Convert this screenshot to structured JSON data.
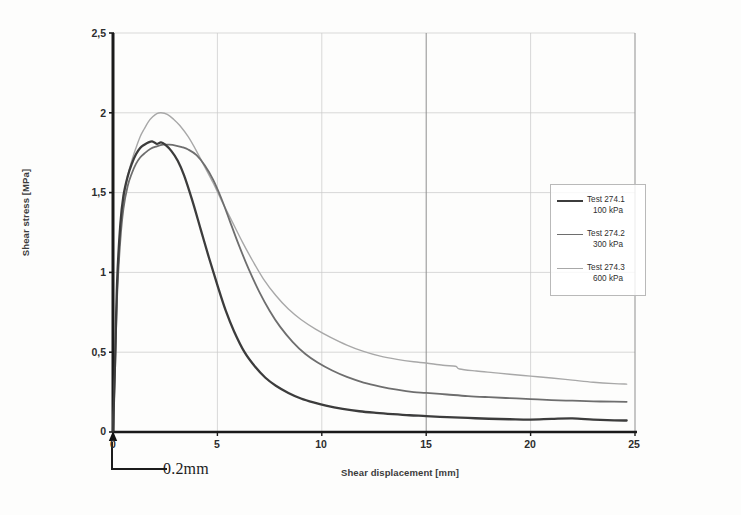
{
  "figure": {
    "background_color": "#fdfdfc",
    "axis_color": "#1a1a1a",
    "grid_color": "#c8c8c8",
    "grid_color_major": "#8f8f8f"
  },
  "axes": {
    "y_title": "Shear stress [MPa]",
    "x_title": "Shear displacement [mm]",
    "y_ticks": [
      "0",
      "0,5",
      "1",
      "1,5",
      "2",
      "2,5"
    ],
    "x_ticks": [
      "0",
      "5",
      "10",
      "15",
      "20",
      "25"
    ]
  },
  "annotation": {
    "callout_label": "0.2mm"
  },
  "legend": {
    "entries": [
      {
        "name": "Test 274.1",
        "sub": "100 kPa",
        "color": "#3c3c3c",
        "width": 2.3
      },
      {
        "name": "Test 274.2",
        "sub": "300 kPa",
        "color": "#6e6e6e",
        "width": 1.8
      },
      {
        "name": "Test 274.3",
        "sub": "600 kPa",
        "color": "#a8a8a8",
        "width": 1.4
      }
    ]
  },
  "chart_data": {
    "type": "line",
    "title": "",
    "xlabel": "Shear displacement [mm]",
    "ylabel": "Shear stress [MPa]",
    "xlim": [
      0,
      25
    ],
    "ylim": [
      0,
      2.5
    ],
    "xticks": [
      0,
      5,
      10,
      15,
      20,
      25
    ],
    "yticks": [
      0,
      0.5,
      1,
      1.5,
      2,
      2.5
    ],
    "grid": true,
    "legend_position": "right",
    "decimal_separator_ticks": ",",
    "annotations": [
      {
        "text": "0.2mm",
        "meaning": "horizontal scale bar below origin indicating 0.2 mm interval"
      }
    ],
    "series": [
      {
        "name": "Test 274.1",
        "label": "Test 274.1 100 kPa",
        "normal_stress_kPa": 100,
        "color": "#3c3c3c",
        "peak_stress_MPa": 1.82,
        "peak_displacement_mm": 2.0,
        "residual_stress_MPa": 0.07,
        "x": [
          0,
          0.1,
          0.2,
          0.35,
          0.5,
          0.7,
          0.9,
          1.1,
          1.3,
          1.5,
          1.7,
          1.9,
          2.1,
          2.3,
          2.5,
          2.8,
          3.1,
          3.4,
          3.8,
          4.2,
          4.6,
          5.0,
          5.4,
          5.8,
          6.3,
          6.8,
          7.3,
          7.8,
          8.4,
          9.0,
          9.6,
          10.2,
          11.0,
          11.8,
          12.6,
          13.4,
          14.2,
          15.0,
          16.0,
          17.0,
          18.0,
          19.0,
          20.0,
          21.0,
          22.0,
          23.0,
          24.0,
          24.6
        ],
        "y": [
          0,
          0.45,
          0.95,
          1.3,
          1.48,
          1.6,
          1.68,
          1.74,
          1.78,
          1.8,
          1.815,
          1.82,
          1.805,
          1.815,
          1.8,
          1.76,
          1.7,
          1.61,
          1.45,
          1.27,
          1.09,
          0.92,
          0.76,
          0.63,
          0.5,
          0.41,
          0.34,
          0.29,
          0.245,
          0.21,
          0.185,
          0.165,
          0.145,
          0.13,
          0.12,
          0.112,
          0.105,
          0.1,
          0.093,
          0.088,
          0.083,
          0.08,
          0.078,
          0.082,
          0.085,
          0.078,
          0.073,
          0.072
        ]
      },
      {
        "name": "Test 274.2",
        "label": "Test 274.2 300 kPa",
        "normal_stress_kPa": 300,
        "color": "#6e6e6e",
        "peak_stress_MPa": 1.8,
        "peak_displacement_mm": 2.4,
        "residual_stress_MPa": 0.19,
        "x": [
          0,
          0.1,
          0.2,
          0.35,
          0.5,
          0.7,
          0.9,
          1.1,
          1.3,
          1.5,
          1.8,
          2.1,
          2.4,
          2.7,
          3.0,
          3.3,
          3.6,
          4.0,
          4.4,
          4.8,
          5.2,
          5.6,
          6.0,
          6.5,
          7.0,
          7.5,
          8.0,
          8.6,
          9.2,
          9.8,
          10.5,
          11.2,
          12.0,
          12.8,
          13.6,
          14.4,
          15.0,
          16.0,
          17.0,
          18.0,
          19.0,
          20.0,
          21.0,
          22.0,
          23.0,
          24.0,
          24.6
        ],
        "y": [
          0,
          0.4,
          0.86,
          1.2,
          1.4,
          1.54,
          1.62,
          1.68,
          1.72,
          1.745,
          1.775,
          1.79,
          1.8,
          1.8,
          1.795,
          1.785,
          1.77,
          1.735,
          1.67,
          1.58,
          1.46,
          1.32,
          1.18,
          1.02,
          0.88,
          0.76,
          0.66,
          0.565,
          0.49,
          0.435,
          0.385,
          0.345,
          0.31,
          0.285,
          0.265,
          0.25,
          0.245,
          0.235,
          0.225,
          0.218,
          0.212,
          0.206,
          0.2,
          0.196,
          0.192,
          0.19,
          0.189
        ]
      },
      {
        "name": "Test 274.3",
        "label": "Test 274.3 600 kPa",
        "normal_stress_kPa": 600,
        "color": "#a8a8a8",
        "peak_stress_MPa": 2.0,
        "peak_displacement_mm": 2.2,
        "residual_stress_MPa": 0.3,
        "x": [
          0,
          0.1,
          0.2,
          0.35,
          0.5,
          0.7,
          0.9,
          1.1,
          1.3,
          1.5,
          1.7,
          1.9,
          2.1,
          2.3,
          2.6,
          2.9,
          3.2,
          3.6,
          4.0,
          4.4,
          4.8,
          5.2,
          5.7,
          6.2,
          6.7,
          7.2,
          7.8,
          8.4,
          9.0,
          9.7,
          10.4,
          11.2,
          12.0,
          12.8,
          13.6,
          14.4,
          15.0,
          15.8,
          16.4,
          16.6,
          17.4,
          18.2,
          19.0,
          20.0,
          21.0,
          22.0,
          23.0,
          24.0,
          24.6
        ],
        "y": [
          0,
          0.42,
          0.9,
          1.25,
          1.45,
          1.6,
          1.7,
          1.78,
          1.85,
          1.9,
          1.945,
          1.975,
          1.995,
          2.0,
          1.99,
          1.96,
          1.92,
          1.85,
          1.76,
          1.66,
          1.56,
          1.45,
          1.32,
          1.19,
          1.07,
          0.96,
          0.855,
          0.77,
          0.705,
          0.645,
          0.595,
          0.545,
          0.505,
          0.475,
          0.455,
          0.44,
          0.432,
          0.418,
          0.412,
          0.395,
          0.382,
          0.372,
          0.362,
          0.35,
          0.338,
          0.325,
          0.312,
          0.303,
          0.3
        ]
      }
    ]
  }
}
